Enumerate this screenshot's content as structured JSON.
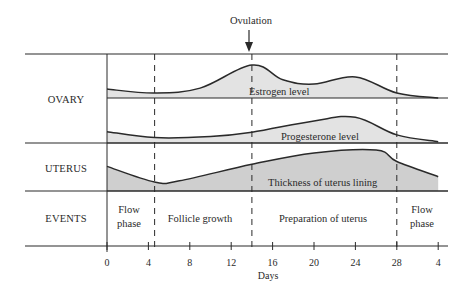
{
  "diagram": {
    "title_annotation": "Ovulation",
    "rows": [
      {
        "id": "ovary",
        "label": "OVARY"
      },
      {
        "id": "uterus",
        "label": "UTERUS"
      },
      {
        "id": "events",
        "label": "EVENTS"
      }
    ],
    "curves": [
      {
        "id": "estrogen",
        "label": "Estrogen level",
        "row": "ovary",
        "fill": "#e3e3e3",
        "points_day_level": [
          [
            0,
            0.27
          ],
          [
            4.6,
            0.15
          ],
          [
            9,
            0.3
          ],
          [
            14,
            1.0
          ],
          [
            17,
            0.55
          ],
          [
            20,
            0.42
          ],
          [
            24,
            0.64
          ],
          [
            28,
            0.15
          ],
          [
            32,
            0.0
          ]
        ]
      },
      {
        "id": "progesterone",
        "label": "Progesterone level",
        "row": "ovary",
        "fill": "#e3e3e3",
        "points_day_level": [
          [
            0,
            0.42
          ],
          [
            4.6,
            0.2
          ],
          [
            10,
            0.24
          ],
          [
            14,
            0.4
          ],
          [
            20,
            0.82
          ],
          [
            24,
            0.95
          ],
          [
            28,
            0.3
          ],
          [
            32,
            0.05
          ]
        ]
      },
      {
        "id": "uterus_lining",
        "label": "Thickness of uterus lining",
        "row": "uterus",
        "fill": "#cfcfcf",
        "points_day_level": [
          [
            0,
            0.6
          ],
          [
            4.6,
            0.22
          ],
          [
            7,
            0.25
          ],
          [
            14,
            0.65
          ],
          [
            20,
            0.93
          ],
          [
            26,
            1.0
          ],
          [
            28,
            0.72
          ],
          [
            32,
            0.35
          ]
        ]
      }
    ],
    "events": [
      {
        "label_line1": "Flow",
        "label_line2": "phase",
        "start_day": 0,
        "end_day": 4.6
      },
      {
        "label_line1": "Follicle growth",
        "label_line2": "",
        "start_day": 4.6,
        "end_day": 14
      },
      {
        "label_line1": "Preparation of uterus",
        "label_line2": "",
        "start_day": 14,
        "end_day": 28
      },
      {
        "label_line1": "Flow",
        "label_line2": "phase",
        "start_day": 28,
        "end_day": 32
      }
    ],
    "dashed_markers_day": [
      4.6,
      14,
      28
    ],
    "ovulation_day": 14,
    "x_axis": {
      "label": "Days",
      "range": [
        0,
        32.5
      ],
      "ticks": [
        {
          "day": 0,
          "label": "0"
        },
        {
          "day": 4,
          "label": "4"
        },
        {
          "day": 8,
          "label": "8"
        },
        {
          "day": 12,
          "label": "12"
        },
        {
          "day": 16,
          "label": "16"
        },
        {
          "day": 20,
          "label": "20"
        },
        {
          "day": 24,
          "label": "24"
        },
        {
          "day": 28,
          "label": "28"
        },
        {
          "day": 32,
          "label": "4"
        }
      ]
    },
    "colors": {
      "line": "#2a2a2a",
      "light_fill": "#e3e3e3",
      "dark_fill": "#cfcfcf"
    }
  }
}
